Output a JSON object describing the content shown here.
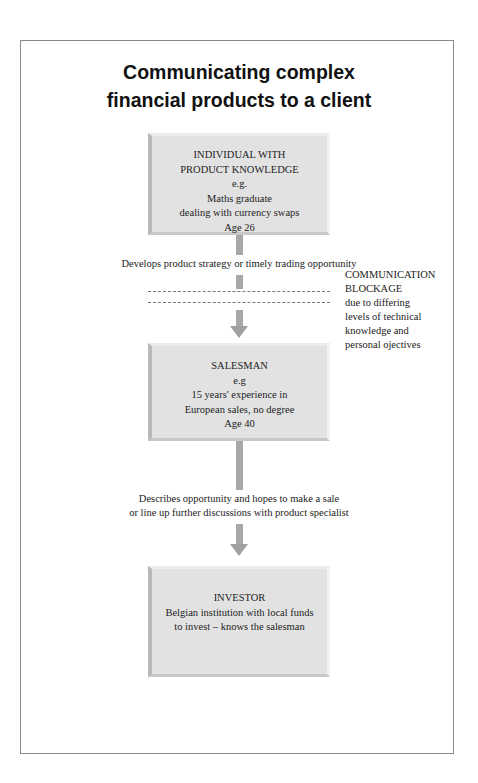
{
  "title": {
    "line1": "Communicating complex",
    "line2": "financial products to a client"
  },
  "boxes": [
    {
      "id": "individual",
      "lines": [
        "INDIVIDUAL WITH",
        "PRODUCT KNOWLEDGE",
        "e.g.",
        "Maths graduate",
        "dealing with currency swaps",
        "Age 26"
      ]
    },
    {
      "id": "salesman",
      "lines": [
        "SALESMAN",
        "e.g",
        "15 years' experience in",
        "European sales, no degree",
        "Age 40"
      ]
    },
    {
      "id": "investor",
      "lines": [
        "INVESTOR",
        "Belgian institution with local funds",
        "to invest – knows the salesman"
      ]
    }
  ],
  "connectors": [
    {
      "label_lines": [
        "Develops product strategy or timely trading opportunity"
      ]
    },
    {
      "label_lines": [
        "Describes opportunity and hopes to make a sale",
        "or line up further discussions with product specialist"
      ]
    }
  ],
  "blockage_note": {
    "lines": [
      "COMMUNICATION",
      "BLOCKAGE",
      "due to differing",
      "levels of technical",
      "knowledge and",
      "personal ojectives"
    ]
  },
  "colors": {
    "box_fill": "#e2e2e2",
    "arrow": "#a8a8a8",
    "frame_border": "#8a8a8a"
  }
}
